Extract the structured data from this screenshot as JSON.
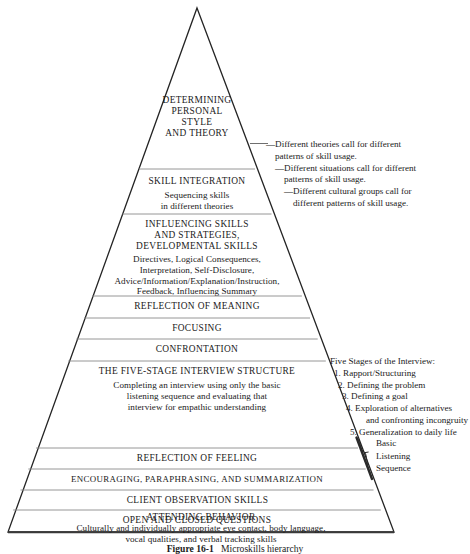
{
  "figure": {
    "caption_label": "Figure 16-1",
    "caption_text": "Microskills hierarchy"
  },
  "colors": {
    "outline": "#242424",
    "divider": "#8a8a8a",
    "base_line": "#3a3a3a",
    "background": "#ffffff",
    "text": "#1a1a1a"
  },
  "pyramid": {
    "levels": [
      {
        "id": "determining-personal-style-and-theory",
        "heading_lines": [
          "DETERMINING",
          "PERSONAL",
          "STYLE",
          "AND THEORY"
        ],
        "detail_lines": []
      },
      {
        "id": "skill-integration",
        "heading_lines": [
          "SKILL INTEGRATION"
        ],
        "detail_lines": [
          "Sequencing skills",
          "in different theories"
        ]
      },
      {
        "id": "influencing-skills-and-strategies",
        "heading_lines": [
          "INFLUENCING SKILLS",
          "AND STRATEGIES,",
          "DEVELOPMENTAL SKILLS"
        ],
        "detail_lines": [
          "Directives, Logical Consequences,",
          "Interpretation, Self-Disclosure,",
          "Advice/Information/Explanation/Instruction,",
          "Feedback, Influencing Summary"
        ]
      },
      {
        "id": "reflection-of-meaning",
        "heading_lines": [
          "REFLECTION OF MEANING"
        ],
        "detail_lines": []
      },
      {
        "id": "focusing",
        "heading_lines": [
          "FOCUSING"
        ],
        "detail_lines": []
      },
      {
        "id": "confrontation",
        "heading_lines": [
          "CONFRONTATION"
        ],
        "detail_lines": []
      },
      {
        "id": "five-stage-interview-structure",
        "heading_lines": [
          "THE FIVE-STAGE INTERVIEW STRUCTURE"
        ],
        "detail_lines": [
          "Completing an interview using only the basic",
          "listening sequence and evaluating that",
          "interview for empathic understanding"
        ]
      },
      {
        "id": "reflection-of-feeling",
        "heading_lines": [
          "REFLECTION OF FEELING"
        ],
        "detail_lines": []
      },
      {
        "id": "encouraging-paraphrasing-summarization",
        "heading_lines": [
          "ENCOURAGING, PARAPHRASING, AND SUMMARIZATION"
        ],
        "detail_lines": []
      },
      {
        "id": "client-observation-skills",
        "heading_lines": [
          "CLIENT OBSERVATION SKILLS"
        ],
        "detail_lines": []
      },
      {
        "id": "open-and-closed-questions",
        "heading_lines": [
          "OPEN AND CLOSED QUESTIONS"
        ],
        "detail_lines": []
      },
      {
        "id": "attending-behavior",
        "heading_lines": [
          "ATTENDING BEHAVIOR"
        ],
        "detail_lines": [
          "Culturally and individually appropriate eye contact, body language,",
          "vocal qualities, and verbal tracking skills"
        ]
      }
    ]
  },
  "annotations": {
    "theory_notes": [
      "—Different theories call for different",
      "patterns of skill usage.",
      "—Different situations call for different",
      "patterns of skill usage.",
      "—Different cultural groups call for",
      "different patterns of skill usage."
    ],
    "five_stages": {
      "title": "Five Stages of the Interview:",
      "items": [
        "1. Rapport/Structuring",
        "2. Defining the problem",
        "3. Defining a goal",
        "4. Exploration of alternatives",
        "and confronting incongruity",
        "5. Generalization to daily life"
      ]
    },
    "basic_listening_sequence": {
      "lines": [
        "Basic",
        "Listening",
        "Sequence"
      ]
    }
  }
}
